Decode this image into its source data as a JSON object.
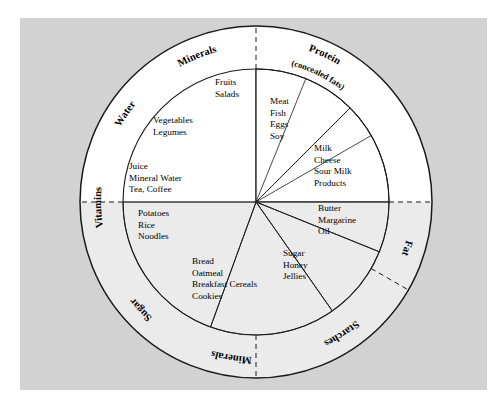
{
  "figure": {
    "background_color": "#ffffff",
    "paper_color": "#d2d2d2",
    "upper_half_fill": "#ffffff",
    "lower_half_fill": "#ebebeb",
    "stroke_color": "#1a1a1a"
  },
  "chart_data": {
    "type": "pie",
    "xlabel": "",
    "ylabel": "",
    "legend_position": "ring",
    "grid": false,
    "center": {
      "x": 256,
      "y": 202
    },
    "inner_radius": 133,
    "outer_radius": 176,
    "categories": [
      "Fruits / Salads",
      "Meat / Fish / Eggs / Soy",
      "Milk / Cheese / Sour Milk Products",
      "Butter / Margarine / Oil",
      "Sugar / Honey / Jellies",
      "Bread / Oatmeal / Breakfast Cereals / Cookies",
      "Potatoes / Rice / Noodles",
      "Juice / Mineral Water / Tea, Coffee",
      "Vegetables / Legumes"
    ],
    "values": [
      22,
      45,
      45,
      22,
      33,
      55,
      45,
      45,
      38
    ],
    "sectors": [
      {
        "id": "fruits",
        "items": [
          "Fruits",
          "Salads"
        ],
        "start_deg": -90,
        "end_deg": -68,
        "fill": "#ffffff",
        "label_x": 215,
        "label_y": 85
      },
      {
        "id": "vegetables",
        "items": [
          "Vegetables",
          "Legumes"
        ],
        "start_deg": -68,
        "end_deg": -30,
        "fill": "#ffffff",
        "label_x": 153,
        "label_y": 123
      },
      {
        "id": "beverages",
        "items": [
          "Juice",
          "Mineral Water",
          "Tea, Coffee"
        ],
        "start_deg": -30,
        "end_deg": 0,
        "fill": "#ffffff",
        "label_x": 129,
        "label_y": 169
      },
      {
        "id": "protein",
        "items": [
          "Meat",
          "Fish",
          "Eggs",
          "Soy"
        ],
        "start_deg": 270,
        "end_deg": 315,
        "fill": "#ffffff",
        "label_x": 270,
        "label_y": 104
      },
      {
        "id": "dairy",
        "items": [
          "Milk",
          "Cheese",
          "Sour Milk",
          "Products"
        ],
        "start_deg": 315,
        "end_deg": 360,
        "fill": "#ffffff",
        "label_x": 314,
        "label_y": 151
      },
      {
        "id": "fats",
        "items": [
          "Butter",
          "Margarine",
          "Oil"
        ],
        "start_deg": 0,
        "end_deg": 22,
        "fill": "#ebebeb",
        "label_x": 318,
        "label_y": 211
      },
      {
        "id": "sugars",
        "items": [
          "Sugar",
          "Honey",
          "Jellies"
        ],
        "start_deg": 22,
        "end_deg": 55,
        "fill": "#ebebeb",
        "label_x": 283,
        "label_y": 256
      },
      {
        "id": "cereals",
        "items": [
          "Bread",
          "Oatmeal",
          "Breakfast Cereals",
          "Cookies"
        ],
        "start_deg": 55,
        "end_deg": 110,
        "fill": "#ebebeb",
        "label_x": 192,
        "label_y": 264
      },
      {
        "id": "starchy",
        "items": [
          "Potatoes",
          "Rice",
          "Noodles"
        ],
        "start_deg": 110,
        "end_deg": 180,
        "fill": "#ebebeb",
        "label_x": 138,
        "label_y": 216
      }
    ],
    "ring_labels": [
      {
        "id": "minerals-top",
        "text": "Minerals",
        "start_deg": 228,
        "end_deg": 268,
        "radius": 155
      },
      {
        "id": "protein",
        "text": "Protein",
        "start_deg": 272,
        "end_deg": 318,
        "radius": 160
      },
      {
        "id": "protein-sub",
        "text": "(concealed fats)",
        "start_deg": 270,
        "end_deg": 322,
        "radius": 141
      },
      {
        "id": "fat",
        "text": "Fat",
        "start_deg": 8,
        "end_deg": 26,
        "radius": 155
      },
      {
        "id": "starches",
        "text": "Starches",
        "start_deg": 38,
        "end_deg": 76,
        "radius": 155
      },
      {
        "id": "minerals-bottom",
        "text": "Minerals",
        "start_deg": 80,
        "end_deg": 118,
        "radius": 155
      },
      {
        "id": "sugar",
        "text": "Sugar",
        "start_deg": 122,
        "end_deg": 152,
        "radius": 155
      },
      {
        "id": "vitamins",
        "text": "Vitamins",
        "start_deg": 160,
        "end_deg": 196,
        "radius": 155
      },
      {
        "id": "water",
        "text": "Water",
        "start_deg": 200,
        "end_deg": 228,
        "radius": 155
      }
    ],
    "ring_dividers_deg": [
      0,
      90,
      180,
      270,
      30
    ]
  }
}
